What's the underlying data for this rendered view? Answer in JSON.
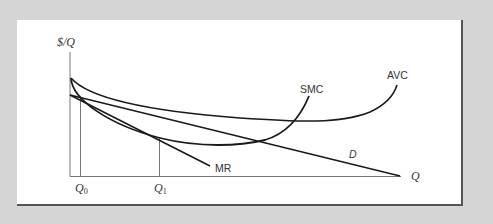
{
  "diagram": {
    "y_axis_label": "$/Q",
    "x_axis_label": "Q",
    "ticks": [
      {
        "label": "Q",
        "sub": "0"
      },
      {
        "label": "Q",
        "sub": "1"
      }
    ],
    "curves": {
      "smc": "SMC",
      "avc": "AVC",
      "mr": "MR",
      "d": "D"
    },
    "colors": {
      "background": "#d6d6d6",
      "panel": "#ffffff",
      "axis": "#777777",
      "curve": "#1a1a1a"
    }
  }
}
